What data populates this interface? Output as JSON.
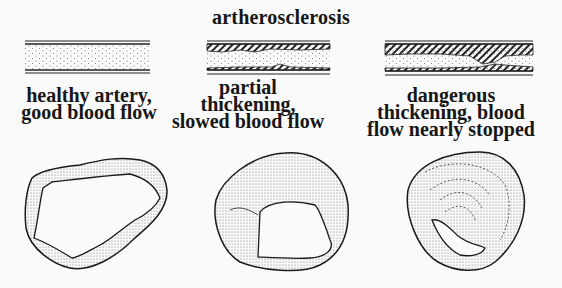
{
  "title": "artherosclerosis",
  "panels": [
    {
      "id": "healthy",
      "caption_lines": [
        "healthy artery,",
        "good blood flow"
      ]
    },
    {
      "id": "partial",
      "caption_lines": [
        "partial",
        "thickening,",
        "slowed blood flow"
      ]
    },
    {
      "id": "dangerous",
      "caption_lines": [
        "dangerous",
        "thickening, blood",
        "flow nearly stopped"
      ]
    }
  ],
  "colors": {
    "ink": "#161616",
    "background": "#fafafa",
    "stipple": "#555555"
  }
}
